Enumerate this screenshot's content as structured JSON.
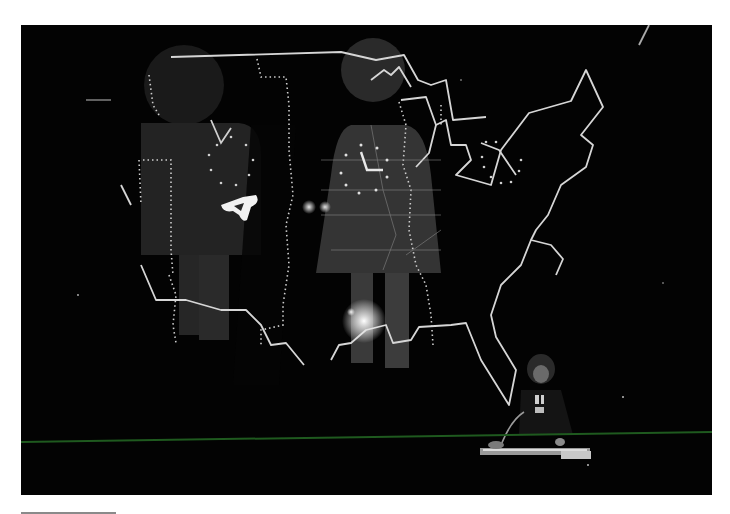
{
  "photo": {
    "subject": "Stage performance with projected outline map of the eastern United States overlaid with large male and female restroom-style pictogram figures; a performer seated at a keyboard with microphone in lower right",
    "elements": {
      "map": "eastern-us-outline-map",
      "figure_left": "male-pictogram",
      "figure_right": "female-pictogram",
      "clock_left": "clock-face-dotted",
      "clock_right": "clock-face-dotted",
      "symbol": "triangle-glyph",
      "performer": "performer-at-keyboard",
      "stage_line": "green-stage-edge"
    },
    "colors": {
      "background": "#030303",
      "map_line": "#d8d8d8",
      "figure_fill": "#2e2e2e",
      "stage_edge": "#1f5a1f",
      "page": "#ffffff",
      "rule": "#8a8a8a"
    }
  }
}
